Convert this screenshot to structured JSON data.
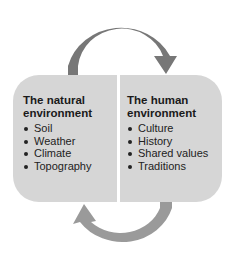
{
  "diagram": {
    "left_box": {
      "title_line1": "The natural",
      "title_line2": "environment",
      "items": [
        "Soil",
        "Weather",
        "Climate",
        "Topography"
      ]
    },
    "right_box": {
      "title_line1": "The human",
      "title_line2": "environment",
      "items": [
        "Culture",
        "History",
        "Shared values",
        "Traditions"
      ]
    },
    "arrows": {
      "top": {
        "direction": "left-to-right",
        "color": "#777777"
      },
      "bottom": {
        "direction": "right-to-left",
        "color": "#9a9a9a"
      }
    },
    "colors": {
      "box_fill": "#d6d6d6",
      "text": "#1a1a1a"
    }
  }
}
